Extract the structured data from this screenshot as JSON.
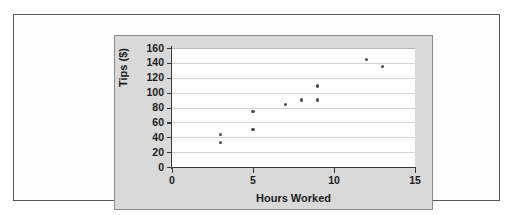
{
  "figure": {
    "background_color": "#fdfdfd",
    "border_color": "#58585a",
    "panel_color": "#d9d9d9",
    "plot_background": "#ffffff",
    "gridline_color": "#d2d2d2",
    "axis_color": "#3a3a3a",
    "marker_color": "#4d4d4d"
  },
  "chart_data": {
    "type": "scatter",
    "title": "",
    "xlabel": "Hours Worked",
    "ylabel": "Tips ($)",
    "xlim": [
      0,
      15
    ],
    "ylim": [
      0,
      160
    ],
    "xticks": [
      0,
      5,
      10,
      15
    ],
    "yticks": [
      0,
      20,
      40,
      60,
      80,
      100,
      120,
      140,
      160
    ],
    "xtick_labels": [
      "0",
      "5",
      "10",
      "15"
    ],
    "ytick_labels": [
      "0",
      "20",
      "40",
      "60",
      "80",
      "100",
      "120",
      "140",
      "160"
    ],
    "grid": "horizontal",
    "legend": "none",
    "series": [
      {
        "name": "Tips vs Hours Worked",
        "points": [
          {
            "x": 3,
            "y": 44
          },
          {
            "x": 3,
            "y": 33
          },
          {
            "x": 5,
            "y": 75
          },
          {
            "x": 5,
            "y": 50
          },
          {
            "x": 7,
            "y": 84
          },
          {
            "x": 8,
            "y": 90
          },
          {
            "x": 9,
            "y": 109
          },
          {
            "x": 9,
            "y": 90
          },
          {
            "x": 12,
            "y": 144
          },
          {
            "x": 13,
            "y": 135
          }
        ]
      }
    ]
  }
}
